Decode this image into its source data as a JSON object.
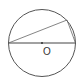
{
  "diagram": {
    "type": "geometry",
    "labels": {
      "center": "O"
    },
    "colors": {
      "stroke": "#555555",
      "background": "#ffffff"
    },
    "circle": {
      "cx": 42,
      "cy": 43,
      "r": 33.5
    },
    "points": {
      "left_end": [
        8.5,
        43
      ],
      "right_end": [
        75.5,
        43
      ],
      "top_point": [
        67,
        20
      ]
    }
  }
}
